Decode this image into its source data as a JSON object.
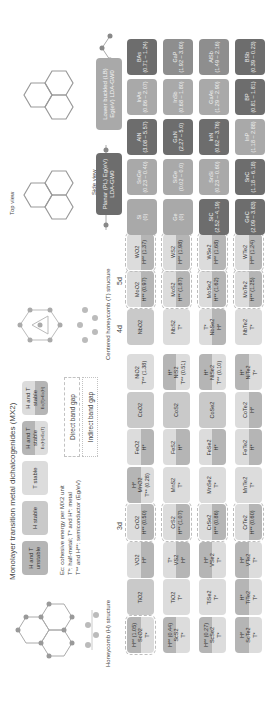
{
  "figure": {
    "title": "Monolayer transition metal dichalcogenides (MX2)",
    "honeycomb_label": "Honeycomb (H) structure",
    "centered_label": "Centered honeycomb (T) structure",
    "top_view_label": "Top view",
    "side_view_label": "Side view",
    "lattice_labels": {
      "a1": "a1",
      "a2": "a2",
      "delta": "Δ"
    }
  },
  "legend": {
    "stability": [
      {
        "label": "H and T unstable",
        "class": "c-unst"
      },
      {
        "label": "H stable",
        "class": "c-h"
      },
      {
        "label": "T stable",
        "class": "c-t"
      },
      {
        "label": "H and T stable",
        "sub": "Ec(H)>Ec(T)",
        "class": "c-split-th"
      },
      {
        "label": "H and T stable",
        "sub": "Ec(T)>Ec(H)",
        "class": "c-split-ht"
      }
    ],
    "notes": [
      "Ec: cohesive energy per MX2 unit",
      "T*: half-metal; T* and H*: metal",
      "T** and H**: semiconductor (Eg/eV)"
    ],
    "gaps": {
      "direct": "Direct band gap",
      "indirect": "Indirect band gap"
    }
  },
  "groups": {
    "d3": "3d",
    "d4": "4d",
    "d5": "5d"
  },
  "tmd_columns": [
    {
      "col": 0,
      "cells": [
        {
          "name": "ScO2",
          "note": "H** (1.05)",
          "sub": "T*",
          "style": "c-split-th",
          "direct": true
        },
        {
          "name": "ScS2",
          "note": "H** (0.44)",
          "sub": "T*",
          "style": "c-split-th",
          "direct": false
        },
        {
          "name": "ScSe2",
          "note": "H** (0.27)",
          "sub": "T*",
          "style": "c-split-th",
          "direct": false
        },
        {
          "name": "ScTe2",
          "note": "H*",
          "sub": "T*",
          "style": "c-split-th",
          "direct": false
        }
      ]
    },
    {
      "col": 1,
      "cells": [
        {
          "name": "TiO2",
          "note": "",
          "sub": "",
          "style": "c-h",
          "direct": false
        },
        {
          "name": "TiO2",
          "note": "",
          "sub": "T*",
          "style": "c-t",
          "direct": false
        },
        {
          "name": "TiSe2",
          "note": "",
          "sub": "T*",
          "style": "c-t",
          "direct": false
        },
        {
          "name": "TiTe2",
          "note": "H*",
          "sub": "T*",
          "style": "c-split-th",
          "direct": false
        }
      ]
    },
    {
      "col": 2,
      "cells": [
        {
          "name": "VO2",
          "note": "",
          "sub": "H*",
          "style": "c-split-ht",
          "direct": false
        },
        {
          "name": "VS2",
          "note": "T*",
          "sub": "H*",
          "style": "c-split-ht",
          "direct": false
        },
        {
          "name": "VSe2",
          "note": "H*",
          "sub": "T*",
          "style": "c-split-th",
          "direct": false
        },
        {
          "name": "VTe2",
          "note": "H*",
          "sub": "T*",
          "style": "c-split-th",
          "direct": false
        }
      ]
    },
    {
      "col": 3,
      "cells": [
        {
          "name": "CrO2",
          "note": "",
          "sub": "H** (0.50)",
          "style": "c-split-ht",
          "direct": true
        },
        {
          "name": "CrS2",
          "note": "",
          "sub": "H** (1.07)",
          "style": "c-split-ht",
          "direct": true
        },
        {
          "name": "CrSe2",
          "note": "",
          "sub": "H** (0.86)",
          "style": "c-split-ht",
          "direct": true
        },
        {
          "name": "CrTe2",
          "note": "",
          "sub": "H** (0.60)",
          "style": "c-split-ht",
          "direct": true
        }
      ]
    },
    {
      "col": 4,
      "cells": [
        {
          "name": "MnO2",
          "note": "H*",
          "sub": "T** (0.28)",
          "style": "c-split-th",
          "direct": false
        },
        {
          "name": "MnS2",
          "note": "",
          "sub": "T*",
          "style": "c-t",
          "direct": false
        },
        {
          "name": "MnSe2",
          "note": "",
          "sub": "T*",
          "style": "c-t",
          "direct": false
        },
        {
          "name": "MnTe2",
          "note": "",
          "sub": "T*",
          "style": "c-t",
          "direct": false
        }
      ]
    },
    {
      "col": 5,
      "cells": [
        {
          "name": "FeO2",
          "note": "",
          "sub": "H*",
          "style": "c-split-ht",
          "direct": false
        },
        {
          "name": "FeS2",
          "note": "",
          "sub": "H*",
          "style": "c-split-ht",
          "direct": false
        },
        {
          "name": "FeSe2",
          "note": "",
          "sub": "H*",
          "style": "c-split-ht",
          "direct": false
        },
        {
          "name": "FeTe2",
          "note": "",
          "sub": "H*",
          "style": "c-split-ht",
          "direct": false
        }
      ]
    },
    {
      "col": 6,
      "cells": [
        {
          "name": "CoO2",
          "note": "",
          "sub": "",
          "style": "c-h",
          "direct": false
        },
        {
          "name": "CoS2",
          "note": "",
          "sub": "",
          "style": "c-h",
          "direct": false
        },
        {
          "name": "CoSe2",
          "note": "",
          "sub": "",
          "style": "c-h",
          "direct": false
        },
        {
          "name": "CoTe2",
          "note": "",
          "sub": "H*",
          "style": "c-split-ht",
          "direct": false
        }
      ]
    },
    {
      "col": 7,
      "cells": [
        {
          "name": "NiO2",
          "note": "",
          "sub": "T** (1.38)",
          "style": "c-t",
          "direct": false
        },
        {
          "name": "NiS2",
          "note": "H*",
          "sub": "T** (0.51)",
          "style": "c-split-th",
          "direct": false
        },
        {
          "name": "NiSe2",
          "note": "H*",
          "sub": "T** (0.10)",
          "style": "c-split-th",
          "direct": false
        },
        {
          "name": "NiTe2",
          "note": "H*",
          "sub": "T*",
          "style": "c-split-th",
          "direct": false
        }
      ]
    },
    {
      "col": 8,
      "cells": [
        {
          "name": "NbO2",
          "note": "",
          "sub": "",
          "style": "c-h",
          "direct": false
        },
        {
          "name": "NbS2",
          "note": "",
          "sub": "T*",
          "style": "c-t",
          "direct": false
        },
        {
          "name": "NbSe2",
          "note": "T*",
          "sub": "H*",
          "style": "c-split-ht",
          "direct": false
        },
        {
          "name": "NbTe2",
          "note": "",
          "sub": "T*",
          "style": "c-t",
          "direct": false
        }
      ]
    },
    {
      "col": 9,
      "cells": [
        {
          "name": "MoO2",
          "note": "",
          "sub": "H** (0.97)",
          "style": "c-split-ht",
          "direct": true
        },
        {
          "name": "MoS2",
          "note": "",
          "sub": "H** (1.87)",
          "style": "c-split-ht",
          "direct": true
        },
        {
          "name": "MoSe2",
          "note": "",
          "sub": "H** (1.62)",
          "style": "c-split-ht",
          "direct": true
        },
        {
          "name": "MoTe2",
          "note": "",
          "sub": "H** (1.25)",
          "style": "c-split-ht",
          "direct": true
        }
      ]
    },
    {
      "col": 10,
      "cells": [
        {
          "name": "WO2",
          "note": "",
          "sub": "H** (1.37)",
          "style": "c-split-ht",
          "direct": true
        },
        {
          "name": "WS2",
          "note": "",
          "sub": "H** (1.98)",
          "style": "c-split-ht",
          "direct": true
        },
        {
          "name": "WSe2",
          "note": "",
          "sub": "H** (1.68)",
          "style": "c-split-ht",
          "direct": true
        },
        {
          "name": "WTe2",
          "note": "",
          "sub": "H** (1.24)",
          "style": "c-split-ht",
          "direct": true
        }
      ]
    }
  ],
  "iiiv": {
    "planar_label": "Planar (PL) Eg(eV) LDA-GW0",
    "buckled_label": "Lower buckled (LB) Eg(eV) LDA-GW0",
    "columns": [
      {
        "cells": [
          {
            "name": "Si",
            "vals": "(0)",
            "shade": "g-light"
          },
          {
            "name": "Ge",
            "vals": "(0)",
            "shade": "g-light"
          },
          {
            "name": "SiC",
            "vals": "(2.52 – 4.19)",
            "shade": "g-dark"
          },
          {
            "name": "GeC",
            "vals": "(2.09 – 3.83)",
            "shade": "g-dark"
          }
        ]
      },
      {
        "cells": [
          {
            "name": "SnGe",
            "vals": "(0.23 – 0.40)",
            "shade": "g-light"
          },
          {
            "name": "SiGe",
            "vals": "(0.02 – 0.0)",
            "shade": "g-light"
          },
          {
            "name": "SnSi",
            "vals": "(0.23 – 0.60)",
            "shade": "g-light"
          },
          {
            "name": "SnC",
            "vals": "(1.18 – 6.18)",
            "shade": "g-dark"
          }
        ]
      },
      {
        "cells": [
          {
            "name": "AlN",
            "vals": "(3.08 – 5.57)",
            "shade": "g-dark"
          },
          {
            "name": "GaN",
            "vals": "(2.27 – 5.0)",
            "shade": "g-dark"
          },
          {
            "name": "InN",
            "vals": "(0.62 – 3.76)",
            "shade": "g-dark"
          },
          {
            "name": "InP",
            "vals": "(1.18 – 2.88)",
            "shade": "g-light"
          }
        ]
      },
      {
        "cells": [
          {
            "name": "InAs",
            "vals": "(0.86 – 2.07)",
            "shade": "g-light"
          },
          {
            "name": "InSb",
            "vals": "(0.68 – 1.80)",
            "shade": "g-light"
          },
          {
            "name": "GaAs",
            "vals": "(1.29 – 2.90)",
            "shade": "g-light"
          },
          {
            "name": "BP",
            "vals": "(0.81 – 1.81)",
            "shade": "g-dark"
          }
        ]
      },
      {
        "cells": [
          {
            "name": "BAs",
            "vals": "(0.71 – 1.24)",
            "shade": "g-dark"
          },
          {
            "name": "GaP",
            "vals": "(1.92 – 3.80)",
            "shade": "g-mid"
          },
          {
            "name": "AlSb",
            "vals": "(1.49 – 2.16)",
            "shade": "g-mid"
          },
          {
            "name": "BSb",
            "vals": "(0.39 – 0.23)",
            "shade": "g-dark"
          }
        ]
      }
    ]
  }
}
